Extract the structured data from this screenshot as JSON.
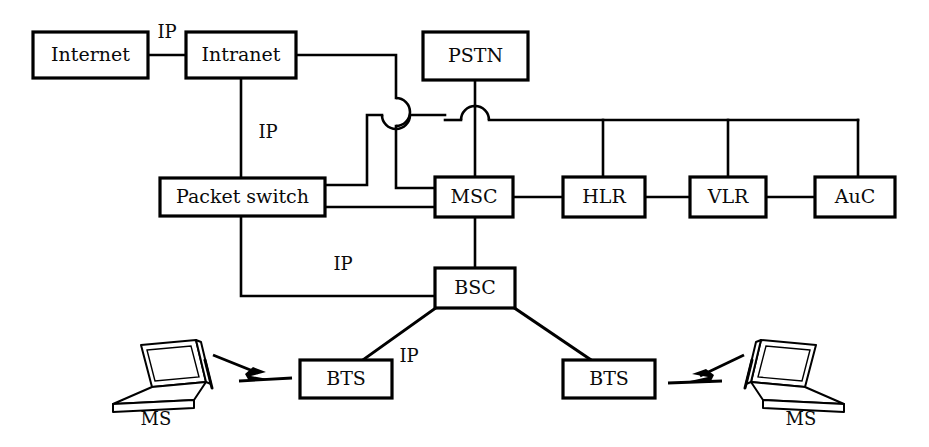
{
  "diagram": {
    "background_color": "#ffffff",
    "line_color": "#000000",
    "nodes": {
      "internet": {
        "label": "Internet",
        "x": 33,
        "y": 32,
        "w": 115,
        "h": 46
      },
      "intranet": {
        "label": "Intranet",
        "x": 186,
        "y": 32,
        "w": 110,
        "h": 46
      },
      "pstn": {
        "label": "PSTN",
        "x": 423,
        "y": 32,
        "w": 105,
        "h": 48
      },
      "packet_switch": {
        "label": "Packet switch",
        "x": 160,
        "y": 178,
        "w": 165,
        "h": 38
      },
      "msc": {
        "label": "MSC",
        "x": 435,
        "y": 177,
        "w": 78,
        "h": 40
      },
      "hlr": {
        "label": "HLR",
        "x": 563,
        "y": 177,
        "w": 82,
        "h": 40
      },
      "vlr": {
        "label": "VLR",
        "x": 690,
        "y": 177,
        "w": 76,
        "h": 40
      },
      "auc": {
        "label": "AuC",
        "x": 815,
        "y": 177,
        "w": 80,
        "h": 40
      },
      "bsc": {
        "label": "BSC",
        "x": 435,
        "y": 268,
        "w": 80,
        "h": 40
      },
      "bts_left": {
        "label": "BTS",
        "x": 300,
        "y": 360,
        "w": 92,
        "h": 38
      },
      "bts_right": {
        "label": "BTS",
        "x": 563,
        "y": 360,
        "w": 92,
        "h": 38
      }
    },
    "terminals": {
      "ms_left": {
        "label": "MS",
        "label_x": 156,
        "label_y": 420
      },
      "ms_right": {
        "label": "MS",
        "label_x": 786,
        "label_y": 420
      }
    },
    "edge_labels": [
      {
        "id": "ip-internet-intranet",
        "text": "IP",
        "x": 167,
        "y": 33
      },
      {
        "id": "ip-intranet-packetswitch",
        "text": "IP",
        "x": 268,
        "y": 133
      },
      {
        "id": "ip-packetswitch-bsc",
        "text": "IP",
        "x": 343,
        "y": 265
      },
      {
        "id": "ip-bsc-bts",
        "text": "IP",
        "x": 409,
        "y": 357
      }
    ],
    "edges": [
      {
        "id": "internet-intranet",
        "from": "internet",
        "to": "intranet",
        "kind": "wired",
        "label": "IP"
      },
      {
        "id": "intranet-packet-switch",
        "from": "intranet",
        "to": "packet_switch",
        "kind": "wired",
        "label": "IP"
      },
      {
        "id": "intranet-msc-bus",
        "from": "intranet",
        "to": "msc",
        "kind": "wired-hop",
        "label": ""
      },
      {
        "id": "packet-switch-msc-upper",
        "from": "packet_switch",
        "to": "msc",
        "kind": "wired-hop",
        "label": ""
      },
      {
        "id": "packet-switch-msc-lower",
        "from": "packet_switch",
        "to": "msc",
        "kind": "wired",
        "label": ""
      },
      {
        "id": "packet-switch-bsc",
        "from": "packet_switch",
        "to": "bsc",
        "kind": "wired",
        "label": "IP"
      },
      {
        "id": "pstn-msc",
        "from": "pstn",
        "to": "msc",
        "kind": "wired",
        "label": ""
      },
      {
        "id": "msc-hlr",
        "from": "msc",
        "to": "hlr",
        "kind": "wired",
        "label": ""
      },
      {
        "id": "hlr-vlr",
        "from": "hlr",
        "to": "vlr",
        "kind": "wired",
        "label": ""
      },
      {
        "id": "vlr-auc",
        "from": "vlr",
        "to": "auc",
        "kind": "wired",
        "label": ""
      },
      {
        "id": "signalling-bus",
        "from": "pstn",
        "to": "auc",
        "kind": "bus",
        "label": ""
      },
      {
        "id": "msc-bsc",
        "from": "msc",
        "to": "bsc",
        "kind": "wired",
        "label": ""
      },
      {
        "id": "bsc-bts-left",
        "from": "bsc",
        "to": "bts_left",
        "kind": "wired",
        "label": "IP"
      },
      {
        "id": "bsc-bts-right",
        "from": "bsc",
        "to": "bts_right",
        "kind": "wired",
        "label": ""
      },
      {
        "id": "bts-left-ms-left",
        "from": "bts_left",
        "to": "ms_left",
        "kind": "radio",
        "label": ""
      },
      {
        "id": "bts-right-ms-right",
        "from": "bts_right",
        "to": "ms_right",
        "kind": "radio",
        "label": ""
      }
    ]
  }
}
